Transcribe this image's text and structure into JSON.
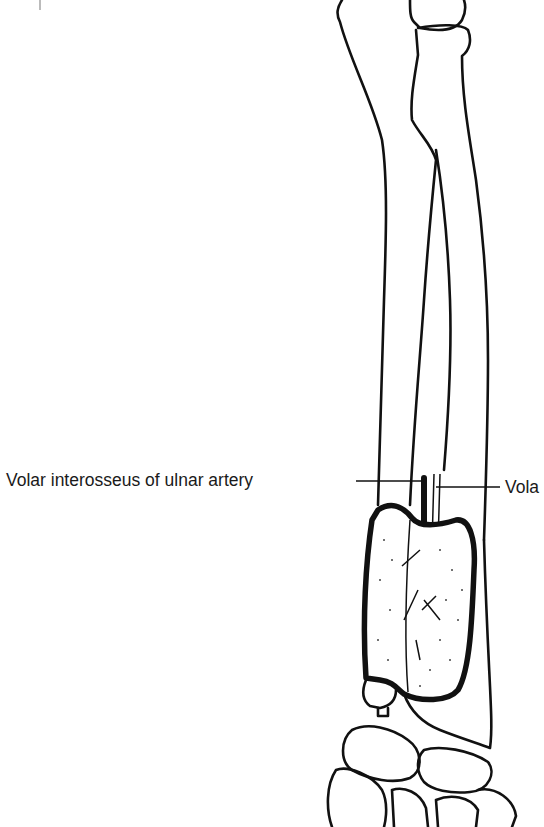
{
  "figure": {
    "type": "anatomical line drawing",
    "labels": [
      {
        "id": "left",
        "text": "Volar interosseus of ulnar artery"
      },
      {
        "id": "right",
        "text": "Vola"
      }
    ],
    "colors": {
      "ink": "#111111",
      "background": "#ffffff"
    }
  }
}
